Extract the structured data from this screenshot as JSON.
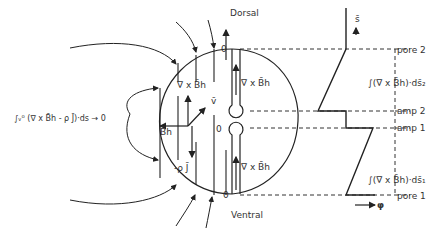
{
  "labels": {
    "dorsal": "Dorsal",
    "ventral": "Ventral",
    "zero_top": "0",
    "zero_mid": "0",
    "zero_bottom": "0",
    "curl_upper_left": "∇ x B̄h",
    "curl_upper_right": "∇ x B̄h",
    "curl_lower_right": "∇ x B̄h",
    "v_bar": "v̄",
    "b_h": "B̄h",
    "minus_rho_j": "-ρ J̄",
    "left_integral": "∫ᵥ⁰ (∇ x B̄h - ρ J̄)·ds → 0",
    "s_axis": "s̄",
    "phi_axis": "φ",
    "pore2": "pore 2",
    "pore1": "pore 1",
    "amp2": "amp 2",
    "amp1": "amp 1",
    "integral_ds2": "∫(∇ x B̄h)·ds̄₂",
    "integral_ds1": "∫(∇ x B̄h)·ds̄₁"
  },
  "colors": {
    "line": "#222222",
    "dash": "#333333"
  }
}
